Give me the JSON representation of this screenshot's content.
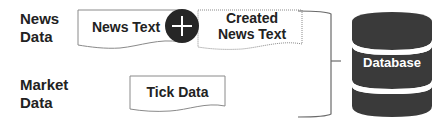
{
  "diagram": {
    "sources": [
      {
        "label_lines": [
          "News",
          "Data"
        ]
      },
      {
        "label_lines": [
          "Market",
          "Data"
        ]
      }
    ],
    "documents": {
      "news_text": {
        "lines": [
          "News Text"
        ]
      },
      "created_news_text": {
        "lines": [
          "Created",
          "News Text"
        ]
      },
      "tick_data": {
        "lines": [
          "Tick Data"
        ]
      }
    },
    "combine_operator": {
      "icon": "plus-icon",
      "symbol": "+"
    },
    "connector": {
      "type": "right-bracket"
    },
    "target": {
      "label": "Database",
      "icon": "database-cylinder-icon"
    }
  },
  "colors": {
    "text": "#222222",
    "document_border": "#8a8a8a",
    "operator_fill": "#262626",
    "database_fill": "#3a3a3a",
    "bracket_stroke": "#6a6a6a",
    "background": "#ffffff"
  }
}
